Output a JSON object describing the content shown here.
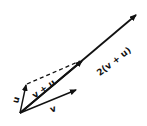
{
  "diagram": {
    "type": "vector-addition",
    "origin": [
      20,
      113
    ],
    "vectors": [
      {
        "id": "u",
        "label": "u",
        "tip": [
          26,
          84
        ],
        "style": "solid"
      },
      {
        "id": "v",
        "label": "v",
        "tip": [
          77,
          89
        ],
        "style": "solid"
      },
      {
        "id": "v_plus_u",
        "label": "v + u",
        "tip": [
          83,
          60
        ],
        "style": "solid"
      },
      {
        "id": "two_v_plus_u",
        "label": "2(v + u)",
        "tip": [
          137,
          14
        ],
        "style": "solid"
      },
      {
        "id": "v_translated",
        "label": "",
        "from": [
          26,
          84
        ],
        "tip": [
          83,
          60
        ],
        "style": "dashed"
      }
    ],
    "labels": {
      "u": "u",
      "v": "v",
      "v_plus_u": "v + u",
      "two_v_plus_u": "2(v + u)"
    },
    "colors": {
      "stroke": "#111111",
      "background": "#ffffff"
    }
  }
}
